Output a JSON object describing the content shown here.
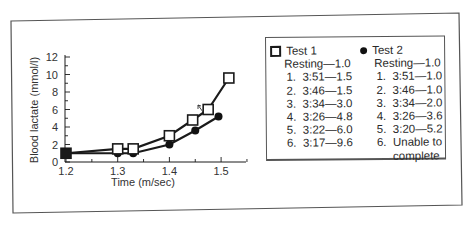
{
  "chart_data": {
    "type": "line",
    "title": "",
    "xlabel": "Time (m/sec)",
    "ylabel": "Blood lactate (mmol/l)",
    "xlim": [
      1.2,
      1.53
    ],
    "ylim": [
      0,
      12
    ],
    "x_ticks": [
      "1.2",
      "1.3",
      "1.4",
      "1.5"
    ],
    "y_ticks": [
      "0",
      "2",
      "4",
      "6",
      "8",
      "10",
      "12"
    ],
    "grid": false,
    "legend_position": "right (boxed)",
    "series": [
      {
        "name": "Test 1",
        "marker": "open-square",
        "x": [
          1.2,
          1.3,
          1.33,
          1.4,
          1.445,
          1.475,
          1.515
        ],
        "values": [
          1.0,
          1.5,
          1.5,
          3.0,
          4.8,
          6.0,
          9.6
        ]
      },
      {
        "name": "Test 2",
        "marker": "filled-circle",
        "x": [
          1.2,
          1.3,
          1.33,
          1.4,
          1.45,
          1.495
        ],
        "values": [
          1.0,
          1.0,
          1.0,
          2.0,
          3.6,
          5.2
        ]
      }
    ],
    "annotations": [
      "small arrow between Test 1 points 4 and 5"
    ]
  },
  "axes": {
    "xlabel": "Time (m/sec)",
    "ylabel": "Blood lactate (mmol/l)",
    "x_ticks": [
      "1.2",
      "1.3",
      "1.4",
      "1.5"
    ],
    "y_ticks": [
      "0",
      "2",
      "4",
      "6",
      "8",
      "10",
      "12"
    ]
  },
  "legend": {
    "test1": {
      "label": "Test 1",
      "resting": "Resting—1.0",
      "items": [
        {
          "num": "1.",
          "text": "3:51—1.5"
        },
        {
          "num": "2.",
          "text": "3:46—1.5"
        },
        {
          "num": "3.",
          "text": "3:34—3.0"
        },
        {
          "num": "4.",
          "text": "3:26—4.8"
        },
        {
          "num": "5.",
          "text": "3:22—6.0"
        },
        {
          "num": "6.",
          "text": "3:17—9.6"
        }
      ]
    },
    "test2": {
      "label": "Test 2",
      "resting": "Resting—1.0",
      "items": [
        {
          "num": "1.",
          "text": "3:51—1.0"
        },
        {
          "num": "2.",
          "text": "3:46—1.0"
        },
        {
          "num": "3.",
          "text": "3:34—2.0"
        },
        {
          "num": "4.",
          "text": "3:26—3.6"
        },
        {
          "num": "5.",
          "text": "3:20—5.2"
        },
        {
          "num": "6.",
          "text": "Unable to"
        }
      ],
      "continuation": "complete"
    }
  },
  "colors": {
    "line": "#1a1a1a",
    "frame": "#555555",
    "text": "#2a2a2a"
  }
}
